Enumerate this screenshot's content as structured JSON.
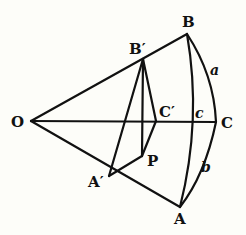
{
  "diagram": {
    "title": "",
    "points": {
      "O": {
        "label": "O",
        "x": 31,
        "y": 121
      },
      "B": {
        "label": "B",
        "x": 187,
        "y": 34
      },
      "Bp": {
        "label": "B′",
        "x": 143,
        "y": 59
      },
      "C": {
        "label": "C",
        "x": 216,
        "y": 122
      },
      "Cp": {
        "label": "C′",
        "x": 156,
        "y": 121
      },
      "A": {
        "label": "A",
        "x": 180,
        "y": 207
      },
      "Ap": {
        "label": "A′",
        "x": 109,
        "y": 176
      },
      "P": {
        "label": "P",
        "x": 142,
        "y": 156
      }
    },
    "arc_labels": {
      "a": "a",
      "b": "b",
      "c": "c"
    },
    "edges": [
      [
        "O",
        "B"
      ],
      [
        "O",
        "C"
      ],
      [
        "O",
        "A"
      ],
      [
        "Bp",
        "Ap"
      ],
      [
        "Bp",
        "P"
      ],
      [
        "Bp",
        "Cp"
      ],
      [
        "Cp",
        "P"
      ],
      [
        "P",
        "Ap"
      ]
    ],
    "arcs": [
      {
        "name": "a",
        "from": "B",
        "to": "C"
      },
      {
        "name": "b",
        "from": "C",
        "to": "A"
      },
      {
        "name": "c",
        "from": "B",
        "to": "A"
      }
    ],
    "colors": {
      "ink": "#111111",
      "paper": "#fdfdf9"
    }
  }
}
